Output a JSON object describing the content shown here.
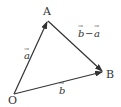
{
  "diagram": {
    "type": "vector-triangle",
    "points": {
      "O": {
        "label": "O",
        "x": 14,
        "y": 94
      },
      "A": {
        "label": "A",
        "x": 48,
        "y": 20
      },
      "B": {
        "label": "B",
        "x": 103,
        "y": 72
      }
    },
    "vectors": [
      {
        "from": "O",
        "to": "A",
        "label_letter": "a",
        "label_arrow": "→"
      },
      {
        "from": "O",
        "to": "B",
        "label_letter": "b",
        "label_arrow": "→"
      },
      {
        "from": "A",
        "to": "B",
        "label": "b−a"
      }
    ],
    "labels": {
      "A": "A",
      "B": "B",
      "O": "O",
      "vec_a": "a",
      "vec_b": "b",
      "vec_b_minus_a_b": "b",
      "vec_b_minus_a_minus": "−",
      "vec_b_minus_a_a": "a",
      "arrow_mark": "→"
    },
    "colors": {
      "stroke": "#333333",
      "text": "#333333"
    }
  }
}
